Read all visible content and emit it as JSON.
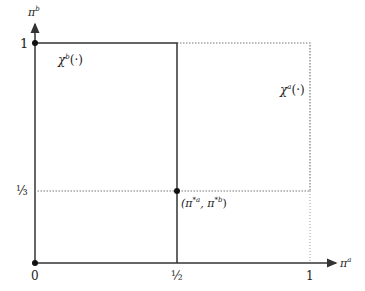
{
  "axes": {
    "x_label": "π",
    "x_label_sup": "a",
    "y_label": "π",
    "y_label_sup": "b",
    "x_ticks": [
      "0",
      "½",
      "1"
    ],
    "y_ticks": [
      "1",
      "⅓"
    ]
  },
  "curves": {
    "chi_b": {
      "symbol": "χ",
      "sup": "b",
      "arg": "(·)",
      "style": "solid"
    },
    "chi_a": {
      "symbol": "χ",
      "sup": "a",
      "arg": "(·)",
      "style": "dotted"
    }
  },
  "equilibrium": {
    "label_open": "(π",
    "sup1": "*a",
    "sep": ", π",
    "sup2": "*b",
    "label_close": ")"
  },
  "colors": {
    "line": "#333333",
    "dotted": "#777777"
  }
}
